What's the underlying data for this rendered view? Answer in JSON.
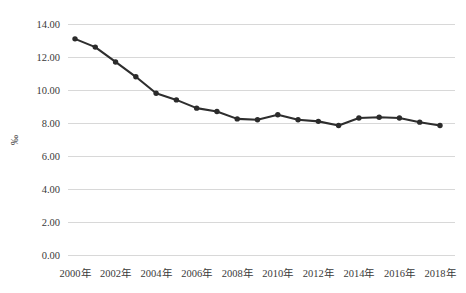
{
  "chart_data": {
    "type": "line",
    "title": "",
    "subtitle": "",
    "xlabel": "",
    "ylabel": "‰",
    "grid": "horizontal",
    "legend_position": "none",
    "ylim": [
      0.0,
      14.0
    ],
    "ytick_step": 2.0,
    "ytick_labels": [
      "0.00",
      "2.00",
      "4.00",
      "6.00",
      "8.00",
      "10.00",
      "12.00",
      "14.00"
    ],
    "ytick_values": [
      0.0,
      2.0,
      4.0,
      6.0,
      8.0,
      10.0,
      12.0,
      14.0
    ],
    "xtick_labels": [
      "2000年",
      "2002年",
      "2004年",
      "2006年",
      "2008年",
      "2010年",
      "2012年",
      "2014年",
      "2016年",
      "2018年"
    ],
    "xtick_values": [
      2000,
      2002,
      2004,
      2006,
      2008,
      2010,
      2012,
      2014,
      2016,
      2018
    ],
    "xlim": [
      2000,
      2018
    ],
    "categories": [
      2000,
      2001,
      2002,
      2003,
      2004,
      2005,
      2006,
      2007,
      2008,
      2009,
      2010,
      2011,
      2012,
      2013,
      2014,
      2015,
      2016,
      2017,
      2018
    ],
    "values": [
      13.1,
      12.6,
      11.7,
      10.8,
      9.8,
      9.4,
      8.9,
      8.7,
      8.25,
      8.2,
      8.5,
      8.2,
      8.1,
      7.85,
      8.3,
      8.35,
      8.3,
      8.05,
      7.85
    ],
    "series": [
      {
        "name": "‰",
        "color": "#2b2b2b",
        "marker": "circle",
        "values": [
          13.1,
          12.6,
          11.7,
          10.8,
          9.8,
          9.4,
          8.9,
          8.7,
          8.25,
          8.2,
          8.5,
          8.2,
          8.1,
          7.85,
          8.3,
          8.35,
          8.3,
          8.05,
          7.85
        ]
      }
    ],
    "colors": {
      "line": "#2b2b2b",
      "marker": "#2b2b2b",
      "grid": "#d4d4d4",
      "text": "#3a3a3a",
      "background": "#ffffff"
    }
  }
}
